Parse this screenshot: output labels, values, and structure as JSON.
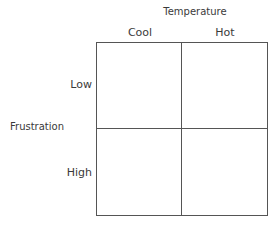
{
  "diagram": {
    "type": "2x2 matrix",
    "column_axis": {
      "title": "Temperature",
      "categories": [
        "Cool",
        "Hot"
      ]
    },
    "row_axis": {
      "title": "Frustration",
      "categories": [
        "Low",
        "High"
      ]
    },
    "cells": [
      {
        "row": "Low",
        "column": "Cool",
        "text": ""
      },
      {
        "row": "Low",
        "column": "Hot",
        "text": ""
      },
      {
        "row": "High",
        "column": "Cool",
        "text": ""
      },
      {
        "row": "High",
        "column": "Hot",
        "text": ""
      }
    ]
  }
}
